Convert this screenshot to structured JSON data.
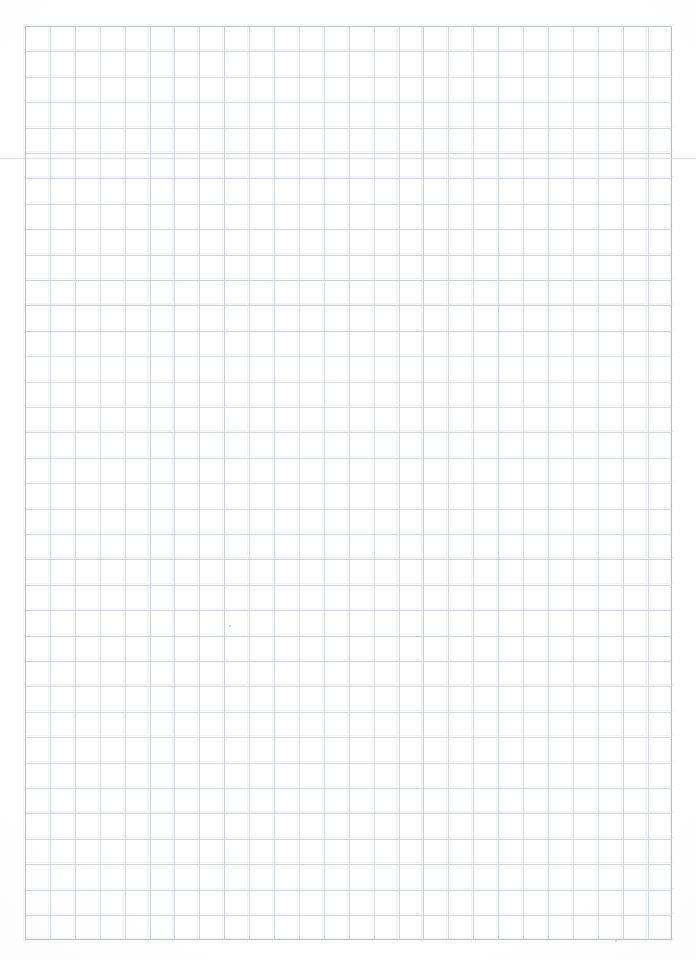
{
  "document": {
    "kind": "scanned-graph-paper",
    "title": "Blank graph paper sheet",
    "page_width": 696,
    "page_height": 961,
    "background_color": "#ffffff",
    "text_content": "",
    "notes": "Blank scanned quadrille / graph ruled sheet. No text, labels, headings or handwriting present."
  },
  "grid": {
    "origin_x": 25,
    "origin_y": 26,
    "end_x": 672,
    "end_y": 940,
    "width": 647,
    "height": 914,
    "columns": 26,
    "rows": 36,
    "cell_width": 24.9,
    "cell_height": 25.4,
    "line_color": "#c3c7cc",
    "line_color_light": "#dfe2e5",
    "line_width": 1,
    "frame_color": "#babec3"
  },
  "artifacts": {
    "scan_line": {
      "name": "faint-horizontal-fold-line",
      "y": 158,
      "color": "#bec1c6",
      "spans_full_width": true
    },
    "specks": [
      {
        "x": 615,
        "y": 940
      },
      {
        "x": 229,
        "y": 625
      }
    ]
  },
  "margins": {
    "left": 25,
    "top": 26,
    "right": 24,
    "bottom": 21
  }
}
